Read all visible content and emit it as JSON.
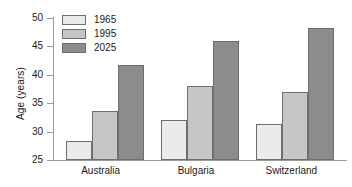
{
  "chart_data": {
    "type": "bar",
    "title": "",
    "xlabel": "",
    "ylabel": "Age (years)",
    "ylim": [
      25,
      50
    ],
    "yticks": [
      25,
      30,
      35,
      40,
      45,
      50
    ],
    "ytick_labels": [
      "25",
      "30",
      "35",
      "40",
      "45",
      "50"
    ],
    "grid": false,
    "legend_position": "top-left",
    "categories": [
      "Australia",
      "Bulgaria",
      "Switzerland"
    ],
    "series": [
      {
        "name": "1965",
        "color": "#ebebeb",
        "values": [
          28.3,
          32.0,
          31.3
        ]
      },
      {
        "name": "1995",
        "color": "#c6c6c6",
        "values": [
          33.6,
          38.0,
          36.9
        ]
      },
      {
        "name": "2025",
        "color": "#8c8c8c",
        "values": [
          41.7,
          46.0,
          48.3
        ]
      }
    ]
  }
}
